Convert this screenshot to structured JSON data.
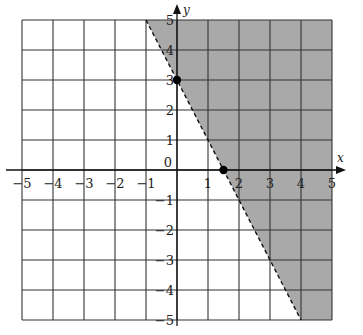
{
  "chart_data": {
    "type": "line",
    "title": "",
    "xlabel": "x",
    "ylabel": "y",
    "xlim": [
      -5,
      5
    ],
    "ylim": [
      -5,
      5
    ],
    "grid": true,
    "x_ticks": [
      "-5",
      "-4",
      "-3",
      "-2",
      "-1",
      "1",
      "2",
      "3",
      "4",
      "5"
    ],
    "y_ticks": [
      "5",
      "4",
      "3",
      "2",
      "1",
      "-1",
      "-2",
      "-3",
      "-4",
      "-5"
    ],
    "origin_label": "0",
    "boundary_line": {
      "equation": "y = -2x + 3",
      "style": "dashed",
      "endpoints": [
        [
          -1,
          5
        ],
        [
          4,
          -5
        ]
      ]
    },
    "points": [
      {
        "x": 0,
        "y": 3,
        "label": "y-intercept"
      },
      {
        "x": 1.5,
        "y": 0,
        "label": "x-intercept"
      }
    ],
    "shaded_region": {
      "inequality": "y > -2x + 3",
      "polygon": [
        [
          -1,
          5
        ],
        [
          5,
          5
        ],
        [
          5,
          -5
        ],
        [
          4,
          -5
        ]
      ],
      "color": "#a9a9a9"
    },
    "colors": {
      "grid": "#333333",
      "shade": "#a9a9a9",
      "line": "#111111",
      "point": "#000000"
    }
  }
}
